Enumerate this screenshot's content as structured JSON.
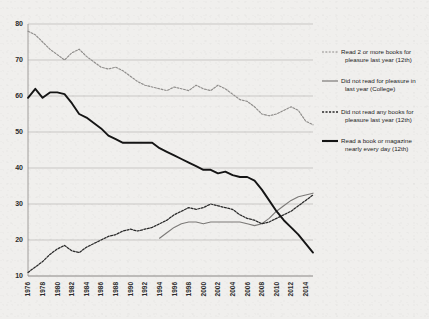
{
  "chart_data": {
    "type": "line",
    "title": "",
    "subtitle": "",
    "xlabel": "",
    "ylabel": "",
    "xlim": [
      1976,
      2015
    ],
    "ylim": [
      10,
      80
    ],
    "grid": true,
    "legend_position": "right",
    "x_tick_labels": [
      "1976",
      "1978",
      "1980",
      "1982",
      "1984",
      "1986",
      "1988",
      "1990",
      "1992",
      "1994",
      "1996",
      "1998",
      "2000",
      "2002",
      "2004",
      "2006",
      "2008",
      "2010",
      "2012",
      "2014"
    ],
    "y_tick_labels": [
      "10",
      "20",
      "30",
      "40",
      "50",
      "60",
      "70",
      "80"
    ],
    "y_ticks": [
      10,
      20,
      30,
      40,
      50,
      60,
      70,
      80
    ],
    "series": [
      {
        "name": "Read 2 or more books for pleasure last year (12th)",
        "style": "dashed",
        "color": "#8f8d8b",
        "x": [
          1976,
          1977,
          1978,
          1979,
          1980,
          1981,
          1982,
          1983,
          1984,
          1985,
          1986,
          1987,
          1988,
          1989,
          1990,
          1991,
          1992,
          1993,
          1994,
          1995,
          1996,
          1997,
          1998,
          1999,
          2000,
          2001,
          2002,
          2003,
          2004,
          2005,
          2006,
          2007,
          2008,
          2009,
          2010,
          2011,
          2012,
          2013,
          2014,
          2015
        ],
        "values": [
          78,
          77,
          75,
          73,
          71.5,
          70,
          72,
          73,
          71,
          69.5,
          68,
          67.5,
          68,
          67,
          65.5,
          64,
          63,
          62.5,
          62,
          61.5,
          62.5,
          62,
          61.5,
          63,
          62,
          61.5,
          63,
          62,
          60.5,
          59,
          58.5,
          57,
          55,
          54.5,
          55,
          56,
          57,
          56,
          53,
          52
        ]
      },
      {
        "name": "Did not read for pleasure in last year (College)",
        "style": "solid",
        "color": "#7c7a78",
        "x": [
          1994,
          1995,
          1996,
          1997,
          1998,
          1999,
          2000,
          2001,
          2002,
          2003,
          2004,
          2005,
          2006,
          2007,
          2008,
          2009,
          2010,
          2011,
          2012,
          2013,
          2014,
          2015
        ],
        "values": [
          20.5,
          22,
          23.5,
          24.5,
          25,
          25,
          24.5,
          25,
          25,
          25,
          25,
          25,
          24.5,
          24,
          24.5,
          26,
          28,
          29.5,
          31,
          32,
          32.5,
          33
        ]
      },
      {
        "name": "Did not read any books for pleasure last year (12th)",
        "style": "dashed",
        "color": "#2a2a2a",
        "x": [
          1976,
          1977,
          1978,
          1979,
          1980,
          1981,
          1982,
          1983,
          1984,
          1985,
          1986,
          1987,
          1988,
          1989,
          1990,
          1991,
          1992,
          1993,
          1994,
          1995,
          1996,
          1997,
          1998,
          1999,
          2000,
          2001,
          2002,
          2003,
          2004,
          2005,
          2006,
          2007,
          2008,
          2009,
          2010,
          2011,
          2012,
          2013,
          2014,
          2015
        ],
        "values": [
          11,
          12.5,
          14,
          16,
          17.5,
          18.5,
          17,
          16.5,
          18,
          19,
          20,
          21,
          21.5,
          22.5,
          23,
          22.5,
          23,
          23.5,
          24.5,
          25.5,
          27,
          28,
          29,
          28.5,
          29,
          30,
          29.5,
          29,
          28.5,
          27,
          26,
          25.5,
          24.5,
          25,
          26,
          27,
          28,
          29.5,
          31,
          32.5
        ]
      },
      {
        "name": "Read a book or magazine nearly every day (12th)",
        "style": "solid",
        "color": "#151515",
        "x": [
          1976,
          1977,
          1978,
          1979,
          1980,
          1981,
          1982,
          1983,
          1984,
          1985,
          1986,
          1987,
          1988,
          1989,
          1990,
          1991,
          1992,
          1993,
          1994,
          1995,
          1996,
          1997,
          1998,
          1999,
          2000,
          2001,
          2002,
          2003,
          2004,
          2005,
          2006,
          2007,
          2008,
          2009,
          2010,
          2011,
          2012,
          2013,
          2014,
          2015
        ],
        "values": [
          59.5,
          62,
          59.5,
          61,
          61,
          60.5,
          58,
          55,
          54,
          52.5,
          51,
          49,
          48,
          47,
          47,
          47,
          47,
          47,
          45.5,
          44.5,
          43.5,
          42.5,
          41.5,
          40.5,
          39.5,
          39.5,
          38.5,
          39,
          38,
          37.5,
          37.5,
          36.5,
          34,
          31,
          28,
          25.5,
          23.5,
          21.5,
          19,
          16.5
        ]
      }
    ]
  },
  "legend": {
    "items": [
      {
        "label_line1": "Read 2 or more books for",
        "label_line2": "pleasure last year (12th)",
        "style": "dashed-light"
      },
      {
        "label_line1": "Did not read for pleasure in",
        "label_line2": "last year (College)",
        "style": "solid-gray"
      },
      {
        "label_line1": "Did not read any books for",
        "label_line2": "pleasure last year (12th)",
        "style": "dashed-dark"
      },
      {
        "label_line1": "Read a book or magazine",
        "label_line2": "nearly every day (12th)",
        "style": "solid-black"
      }
    ]
  },
  "colors": {
    "background": "#f0efed",
    "grid": "#b9b7b4",
    "axis": "#8d8b88",
    "series_a": "#8f8d8b",
    "series_b": "#7c7a78",
    "series_c": "#2a2a2a",
    "series_d": "#151515"
  }
}
